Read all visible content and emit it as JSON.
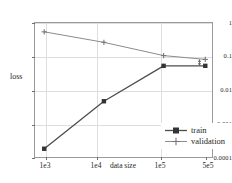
{
  "chart_data": {
    "type": "line",
    "title": "",
    "xlabel": "data size",
    "ylabel": "loss",
    "xscale": "log",
    "yscale": "log",
    "grid": true,
    "xlim": [
      700,
      700000
    ],
    "ylim": [
      0.0001,
      1
    ],
    "x": [
      1000,
      10000,
      100000,
      500000
    ],
    "xtick_labels": [
      "1e3",
      "1e4",
      "1e5",
      "5e5"
    ],
    "ytick_labels": [
      "1",
      "0.1",
      "0.01",
      "0.001",
      "0.0001"
    ],
    "ytick_values": [
      1,
      0.1,
      0.01,
      0.001,
      0.0001
    ],
    "legend_position": "center right",
    "series": [
      {
        "name": "train",
        "color": "#4d4d4d",
        "marker": "square",
        "values": [
          0.0002,
          0.005,
          0.055,
          0.055
        ]
      },
      {
        "name": "validation",
        "color": "#8c8c8c",
        "marker": "plus",
        "values": [
          0.55,
          0.27,
          0.11,
          0.085
        ]
      }
    ],
    "annotations": [
      {
        "name": "generalization-gap-arrow",
        "type": "double-headed-vertical-arrow",
        "x": 400000,
        "y_top": 0.085,
        "y_bottom": 0.055,
        "label": ""
      }
    ]
  },
  "legend": {
    "items": [
      {
        "label": "train"
      },
      {
        "label": "validation"
      }
    ]
  },
  "colors": {
    "train": "#4d4d4d",
    "validation": "#8c8c8c",
    "grid": "#dedede",
    "frame": "#9a9a9a",
    "text": "#1f1f1f"
  }
}
